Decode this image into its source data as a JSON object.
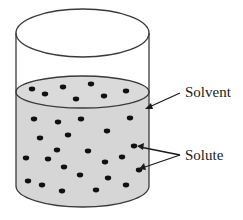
{
  "diagram": {
    "type": "beaker-solution",
    "labels": {
      "solvent": "Solvent",
      "solute": "Solute"
    },
    "colors": {
      "liquid": "#d6d6d6",
      "outline": "#3a3a3a",
      "particle": "#111111",
      "background": "#ffffff"
    },
    "surface_particles": [
      [
        32,
        89
      ],
      [
        45,
        94
      ],
      [
        63,
        87
      ],
      [
        91,
        84
      ],
      [
        76,
        99
      ],
      [
        104,
        96
      ],
      [
        126,
        91
      ]
    ],
    "bulk_particles": [
      [
        34,
        119
      ],
      [
        58,
        122
      ],
      [
        81,
        119
      ],
      [
        130,
        118
      ],
      [
        40,
        138
      ],
      [
        68,
        135
      ],
      [
        107,
        131
      ],
      [
        57,
        150
      ],
      [
        88,
        151
      ],
      [
        134,
        146
      ],
      [
        26,
        158
      ],
      [
        48,
        159
      ],
      [
        122,
        157
      ],
      [
        105,
        162
      ],
      [
        64,
        167
      ],
      [
        80,
        175
      ],
      [
        108,
        178
      ],
      [
        28,
        181
      ],
      [
        42,
        185
      ],
      [
        62,
        191
      ],
      [
        96,
        190
      ],
      [
        126,
        185
      ],
      [
        139,
        170
      ]
    ]
  }
}
